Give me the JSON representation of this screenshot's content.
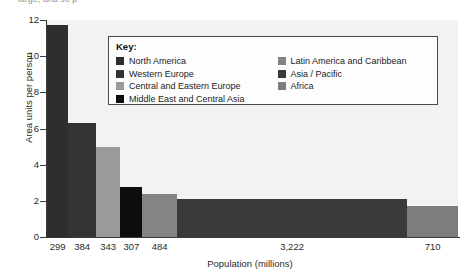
{
  "top_caption": "large, and so p",
  "axes": {
    "ylabel": "Area units per person",
    "xlabel": "Population (millions)",
    "yticks": [
      "0",
      "2",
      "4",
      "6",
      "8",
      "10",
      "12"
    ],
    "xticklabels": [
      "299",
      "384",
      "343",
      "307",
      "484",
      "3,222",
      "710"
    ]
  },
  "legend": {
    "title": "Key:",
    "left_items": [
      {
        "label": "North America",
        "color": "#2e2e2e"
      },
      {
        "label": "Western Europe",
        "color": "#333333"
      },
      {
        "label": "Central and Eastern Europe",
        "color": "#9a9a9a"
      },
      {
        "label": "Middle East and Central Asia",
        "color": "#0d0d0d"
      }
    ],
    "right_items": [
      {
        "label": "Latin America and Caribbean",
        "color": "#848484"
      },
      {
        "label": "Asia / Pacific",
        "color": "#3a3a3a"
      },
      {
        "label": "Africa",
        "color": "#7d7d7d"
      }
    ]
  },
  "chart_data": {
    "type": "bar",
    "title": "",
    "subtitle": "",
    "xlabel": "Population (millions)",
    "ylabel": "Area units per person",
    "ylim": [
      0,
      12
    ],
    "grid": false,
    "legend_position": "inside-top-center",
    "variable_width": true,
    "width_unit": "population (millions)",
    "height_unit": "area units per person",
    "categories": [
      "North America",
      "Western Europe",
      "Central and Eastern Europe",
      "Middle East and Central Asia",
      "Latin America and Caribbean",
      "Asia / Pacific",
      "Africa"
    ],
    "widths": [
      299,
      384,
      343,
      307,
      484,
      3222,
      710
    ],
    "values": [
      11.7,
      6.3,
      5.0,
      2.75,
      2.4,
      2.1,
      1.7
    ],
    "colors": [
      "#2e2e2e",
      "#333333",
      "#9a9a9a",
      "#0d0d0d",
      "#848484",
      "#3a3a3a",
      "#7d7d7d"
    ],
    "xtick_values": [
      "299",
      "384",
      "343",
      "307",
      "484",
      "3,222",
      "710"
    ]
  },
  "style": {
    "plot_bg": "#f2f2f2",
    "page_bg": "#ffffff",
    "axis_color": "#3a3a3a",
    "text_color": "#2b2b2b"
  }
}
